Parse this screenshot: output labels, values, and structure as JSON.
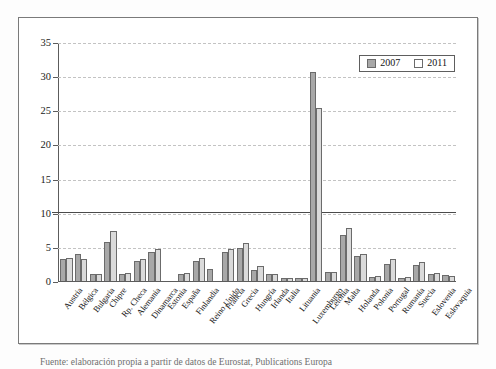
{
  "figure": {
    "caption": "Fuente: elaboración propia a partir de datos de Eurostat, Publications Europa"
  },
  "legend": {
    "position": "top-right",
    "entries": [
      {
        "label": "2007",
        "color": "#a8a8a8"
      },
      {
        "label": "2011",
        "color": "#ffffff"
      }
    ]
  },
  "axis": {
    "y_ticks": [
      "0",
      "5",
      "10",
      "15",
      "20",
      "25",
      "30",
      "35"
    ]
  },
  "chart_data": {
    "type": "bar",
    "title": "",
    "xlabel": "",
    "ylabel": "",
    "ylim": [
      0,
      35
    ],
    "grid": true,
    "legend_position": "top-right",
    "reference_line": {
      "value": 10.3,
      "style": "solid",
      "color": "#4a4a4a"
    },
    "categories": [
      "Austria",
      "Bélgica",
      "Bulgaria",
      "Chipre",
      "Rp. Checa",
      "Alemania",
      "Dinamarca",
      "Estonia",
      "España",
      "Finlandia",
      "Reino Unido",
      "Francia",
      "Grecia",
      "Hungría",
      "Irlanda",
      "Italia",
      "Lituania",
      "Luxemburgo",
      "Letonia",
      "Malta",
      "Holanda",
      "Polonia",
      "Portugal",
      "Rumanía",
      "Suecia",
      "Eslovenia",
      "Eslovaquia"
    ],
    "series": [
      {
        "name": "2007",
        "color": "#a8a8a8",
        "values": [
          3.2,
          3.9,
          1.0,
          5.7,
          1.0,
          3.0,
          4.2,
          0.0,
          1.1,
          2.9,
          1.7,
          4.3,
          4.8,
          1.6,
          1.0,
          0.5,
          0.5,
          30.8,
          1.3,
          6.8,
          3.7,
          0.6,
          2.5,
          0.5,
          2.3,
          1.0,
          0.9
        ]
      },
      {
        "name": "2011",
        "color": "#dadada",
        "values": [
          3.4,
          3.2,
          1.0,
          7.4,
          1.2,
          3.2,
          4.7,
          0.0,
          1.2,
          3.4,
          0.0,
          4.7,
          5.6,
          2.2,
          1.0,
          0.5,
          0.5,
          25.5,
          1.3,
          7.8,
          4.0,
          0.8,
          3.2,
          0.6,
          2.8,
          1.2,
          0.7
        ]
      }
    ]
  }
}
